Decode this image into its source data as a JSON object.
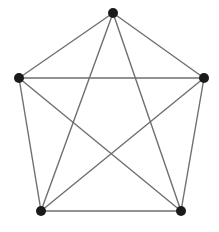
{
  "figure": {
    "background_color": "#ffffff",
    "width": 219,
    "height": 232
  },
  "style": {
    "edge_color": "#6f6f6f",
    "edge_width": 1.4,
    "vertex_color": "#1a1a1a",
    "vertex_radius": 5
  },
  "chart_data": {
    "type": "diagram",
    "diagram_kind": "graph",
    "subtitle": "",
    "xlabel": "",
    "ylabel": "",
    "grid": false,
    "legend": "none",
    "node_count": 5,
    "edge_count": 10,
    "nodes": [
      {
        "id": "v1",
        "label": "",
        "x": 113,
        "y": 13,
        "role": "top"
      },
      {
        "id": "v2",
        "label": "",
        "x": 204,
        "y": 78,
        "role": "upper-right"
      },
      {
        "id": "v3",
        "label": "",
        "x": 181,
        "y": 211,
        "role": "lower-right"
      },
      {
        "id": "v4",
        "label": "",
        "x": 41,
        "y": 211,
        "role": "lower-left"
      },
      {
        "id": "v5",
        "label": "",
        "x": 19,
        "y": 78,
        "role": "upper-left"
      }
    ],
    "edges": [
      {
        "from": "v1",
        "to": "v2",
        "kind": "outer"
      },
      {
        "from": "v2",
        "to": "v3",
        "kind": "outer"
      },
      {
        "from": "v3",
        "to": "v4",
        "kind": "outer"
      },
      {
        "from": "v4",
        "to": "v5",
        "kind": "outer"
      },
      {
        "from": "v5",
        "to": "v1",
        "kind": "outer"
      },
      {
        "from": "v1",
        "to": "v3",
        "kind": "diagonal"
      },
      {
        "from": "v1",
        "to": "v4",
        "kind": "diagonal"
      },
      {
        "from": "v2",
        "to": "v4",
        "kind": "diagonal"
      },
      {
        "from": "v2",
        "to": "v5",
        "kind": "diagonal"
      },
      {
        "from": "v3",
        "to": "v5",
        "kind": "diagonal"
      }
    ]
  }
}
